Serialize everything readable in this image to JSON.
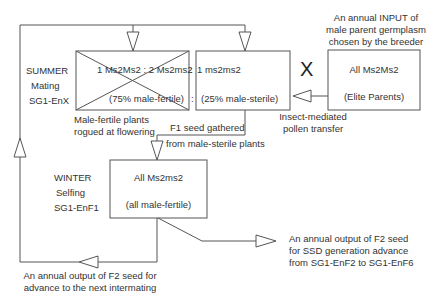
{
  "input_note": {
    "lines": [
      "An annual INPUT of",
      "male parent germplasm",
      "chosen by the breeder"
    ]
  },
  "summer": {
    "season": "SUMMER",
    "activity": "Mating",
    "generation": "SG1-EnX",
    "ratio_part1": "1 Ms2Ms2 : 2 Ms2ms2",
    "ratio_sep": ":",
    "ratio_part2": "1 ms2ms2",
    "fertile_pct": "(75% male-fertile)",
    "colon2": ":",
    "sterile_pct": "(25% male-sterile)",
    "rogued_note": [
      "Male-fertile plants",
      "rogued at flowering"
    ]
  },
  "cross_symbol": "X",
  "elite": {
    "genotype": "All Ms2Ms2",
    "label": "(Elite Parents)"
  },
  "pollen_note": [
    "Insect-mediated",
    "pollen transfer"
  ],
  "f1_note": [
    "F1 seed gathered",
    "from male-sterile plants"
  ],
  "winter": {
    "season": "WINTER",
    "activity": "Selfing",
    "generation": "SG1-EnF1",
    "genotype": "All Ms2ms2",
    "label": "(all male-fertile)"
  },
  "output_ssd": [
    "An annual output of F2 seed",
    "for SSD generation advance",
    "from SG1-EnF2 to SG1-EnF6"
  ],
  "output_intermating": [
    "An annual output of F2 seed for",
    "advance to the next intermating"
  ],
  "colors": {
    "line": "#555555",
    "text": "#333333",
    "background": "#ffffff"
  }
}
